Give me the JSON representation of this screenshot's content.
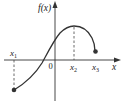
{
  "diagram": {
    "title": "",
    "labels": {
      "y_axis": "f(x)",
      "x_axis": "x",
      "origin": "0",
      "x1": "x",
      "x1_sub": "1",
      "x2": "x",
      "x2_sub": "2",
      "x3": "x",
      "x3_sub": "3"
    },
    "colors": {
      "curve": "#333333",
      "axes": "#333333",
      "dashed": "#444444"
    }
  }
}
